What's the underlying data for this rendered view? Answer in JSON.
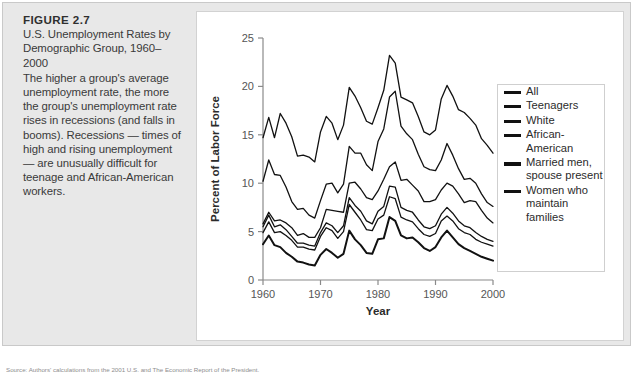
{
  "figure": {
    "label": "FIGURE 2.7",
    "title": "U.S. Unemployment Rates by Demographic Group, 1960–2000",
    "body": "The higher a group's average unemployment rate, the more the group's unemployment rate rises in recessions (and falls in booms). Recessions — times of high and rising unemployment — are unusually difficult for teenage and African-American workers.",
    "source": "Source: Authors' calculations from the 2001 U.S. and The Economic Report of the President."
  },
  "chart_data": {
    "type": "line",
    "title": "U.S. Unemployment Rates by Demographic Group, 1960–2000",
    "xlabel": "Year",
    "ylabel": "Percent of Labor Force",
    "xlim": [
      1960,
      2000
    ],
    "ylim": [
      0,
      25
    ],
    "xticks": [
      1960,
      1970,
      1980,
      1990,
      2000
    ],
    "yticks": [
      0,
      5,
      10,
      15,
      20,
      25
    ],
    "grid": false,
    "legend_position": "right",
    "x": [
      1960,
      1961,
      1962,
      1963,
      1964,
      1965,
      1966,
      1967,
      1968,
      1969,
      1970,
      1971,
      1972,
      1973,
      1974,
      1975,
      1976,
      1977,
      1978,
      1979,
      1980,
      1981,
      1982,
      1983,
      1984,
      1985,
      1986,
      1987,
      1988,
      1989,
      1990,
      1991,
      1992,
      1993,
      1994,
      1995,
      1996,
      1997,
      1998,
      1999,
      2000
    ],
    "series": [
      {
        "name": "All",
        "width": 1.3,
        "values": [
          5.5,
          6.7,
          5.5,
          5.7,
          5.2,
          4.5,
          3.8,
          3.8,
          3.6,
          3.5,
          4.9,
          5.9,
          5.6,
          4.9,
          5.6,
          8.5,
          7.7,
          7.1,
          6.1,
          5.8,
          7.1,
          7.6,
          9.7,
          9.6,
          7.5,
          7.2,
          7.0,
          6.2,
          5.5,
          5.3,
          5.6,
          6.8,
          7.5,
          6.9,
          6.1,
          5.6,
          5.4,
          4.9,
          4.5,
          4.2,
          4.0
        ]
      },
      {
        "name": "Teenagers",
        "width": 1.3,
        "values": [
          14.7,
          16.8,
          14.7,
          17.2,
          16.2,
          14.8,
          12.8,
          12.9,
          12.7,
          12.2,
          15.3,
          16.9,
          16.2,
          14.5,
          16.0,
          19.9,
          19.0,
          17.8,
          16.4,
          16.1,
          17.8,
          19.6,
          23.2,
          22.4,
          18.9,
          18.6,
          18.3,
          16.9,
          15.3,
          15.0,
          15.5,
          18.7,
          20.1,
          19.0,
          17.6,
          17.3,
          16.7,
          16.0,
          14.6,
          13.9,
          13.1
        ]
      },
      {
        "name": "White",
        "width": 1.3,
        "values": [
          4.9,
          6.0,
          4.9,
          5.0,
          4.6,
          4.1,
          3.4,
          3.4,
          3.2,
          3.1,
          4.5,
          5.4,
          5.1,
          4.3,
          5.0,
          7.8,
          7.0,
          6.2,
          5.2,
          5.1,
          6.3,
          6.7,
          8.6,
          8.4,
          6.5,
          6.2,
          6.0,
          5.3,
          4.7,
          4.5,
          4.8,
          6.1,
          6.6,
          6.1,
          5.3,
          4.9,
          4.7,
          4.2,
          3.9,
          3.7,
          3.5
        ]
      },
      {
        "name": "African-American",
        "width": 1.3,
        "values": [
          10.2,
          12.4,
          10.9,
          10.8,
          9.6,
          8.1,
          7.3,
          7.4,
          6.7,
          6.4,
          8.2,
          9.9,
          10.0,
          9.0,
          9.9,
          13.8,
          13.1,
          13.1,
          11.9,
          11.3,
          14.3,
          15.6,
          18.9,
          19.5,
          15.9,
          15.1,
          14.5,
          13.0,
          11.7,
          11.4,
          11.3,
          12.4,
          14.1,
          12.9,
          11.5,
          10.4,
          10.5,
          10.0,
          8.9,
          8.0,
          7.6
        ]
      },
      {
        "name": "Married men, spouse present",
        "width": 2.0,
        "values": [
          3.7,
          4.6,
          3.6,
          3.4,
          2.8,
          2.4,
          1.9,
          1.8,
          1.6,
          1.5,
          2.6,
          3.2,
          2.8,
          2.3,
          2.7,
          5.1,
          4.2,
          3.6,
          2.8,
          2.7,
          4.2,
          4.3,
          6.5,
          6.1,
          4.6,
          4.3,
          4.4,
          3.9,
          3.3,
          3.0,
          3.4,
          4.4,
          5.1,
          4.4,
          3.7,
          3.3,
          3.0,
          2.7,
          2.4,
          2.2,
          2.0
        ]
      },
      {
        "name": "Women who maintain families",
        "width": 1.3,
        "values": [
          5.8,
          7.0,
          6.1,
          6.2,
          5.9,
          5.4,
          4.6,
          4.8,
          4.4,
          4.4,
          5.4,
          7.3,
          7.2,
          7.1,
          7.0,
          10.0,
          10.1,
          9.4,
          8.5,
          8.3,
          9.2,
          10.4,
          11.7,
          12.2,
          10.3,
          10.4,
          9.8,
          9.2,
          8.1,
          8.1,
          8.3,
          9.3,
          10.0,
          9.7,
          8.9,
          8.0,
          8.2,
          8.1,
          7.2,
          6.4,
          5.9
        ]
      }
    ]
  },
  "legend": {
    "items": [
      {
        "label": "All"
      },
      {
        "label": "Teenagers"
      },
      {
        "label": "White"
      },
      {
        "label": "African-American"
      },
      {
        "label": "Married men, spouse present"
      },
      {
        "label": "Women who maintain families"
      }
    ]
  }
}
